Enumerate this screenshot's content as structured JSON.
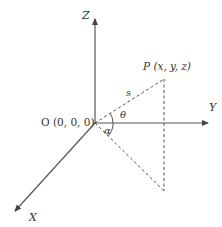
{
  "diagram": {
    "axes": {
      "z_label": "Z",
      "y_label": "Y",
      "x_label": "X"
    },
    "origin_label": "O (0, 0, 0)",
    "point_label": "P (x, y, z)",
    "segment_label": "s",
    "angles": {
      "theta": "θ",
      "alpha": "α"
    },
    "colors": {
      "line": "#444444",
      "background": "#ffffff"
    }
  }
}
